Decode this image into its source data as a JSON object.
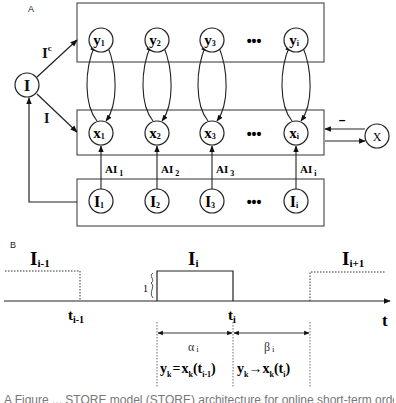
{
  "panel_a": {
    "label": "A",
    "input_node": "I",
    "edge_labels": {
      "complement": "I",
      "complement_sup": "c",
      "direct": "I"
    },
    "columns": [
      {
        "y": "y",
        "y_sub": "1",
        "x": "x",
        "x_sub": "1",
        "in": "I",
        "in_sub": "1",
        "ai": "AI",
        "ai_sub": "1"
      },
      {
        "y": "y",
        "y_sub": "2",
        "x": "x",
        "x_sub": "2",
        "in": "I",
        "in_sub": "2",
        "ai": "AI",
        "ai_sub": "2"
      },
      {
        "y": "y",
        "y_sub": "3",
        "x": "x",
        "x_sub": "3",
        "in": "I",
        "in_sub": "3",
        "ai": "AI",
        "ai_sub": "3"
      },
      {
        "y": "y",
        "y_sub": "i",
        "x": "x",
        "x_sub": "i",
        "in": "I",
        "in_sub": "i",
        "ai": "AI",
        "ai_sub": "i"
      }
    ],
    "ellipsis": "•••",
    "inhibitor_node": "X",
    "inhibitor_sign": "–"
  },
  "panel_b": {
    "label": "B",
    "pulses": [
      {
        "name": "I",
        "sub": "i-1",
        "style": "dotted"
      },
      {
        "name": "I",
        "sub": "i",
        "style": "solid"
      },
      {
        "name": "I",
        "sub": "i+1",
        "style": "dotted"
      }
    ],
    "amplitude_label": "1",
    "time_ticks": [
      {
        "t": "t",
        "sub": "i-1"
      },
      {
        "t": "t",
        "sub": "i"
      }
    ],
    "axis_label": "t",
    "intervals": [
      {
        "name": "α",
        "sub": "i",
        "rule_lhs": "y",
        "rule_lhs_sub": "k",
        "rule_op": "=",
        "rule_rhs": "x",
        "rule_rhs_sub": "k",
        "rule_arg": "(t",
        "rule_arg_sub": "i-1",
        "rule_close": ")"
      },
      {
        "name": "β",
        "sub": "i",
        "rule_lhs": "y",
        "rule_lhs_sub": "k",
        "rule_op": "→",
        "rule_rhs": "x",
        "rule_rhs_sub": "k",
        "rule_arg": "(t",
        "rule_arg_sub": "i",
        "rule_close": ")"
      }
    ]
  },
  "caption": "A Figure ... STORE model (STORE) architecture for online short-term order memory ..."
}
